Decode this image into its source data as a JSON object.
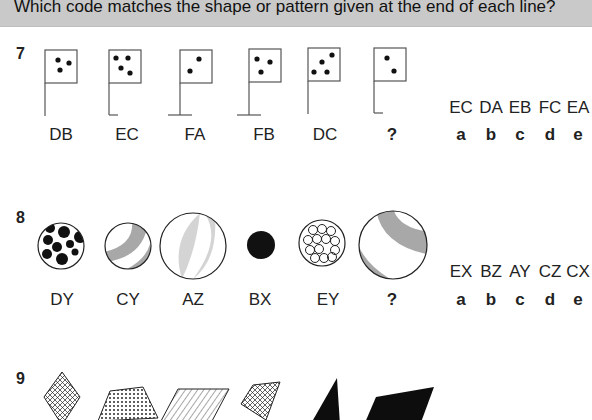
{
  "header": {
    "instruction": "Which code matches the shape or pattern given at the end of each line?"
  },
  "questions": [
    {
      "number": "7",
      "figures": [
        {
          "code": "DB",
          "description": "flag with 3 dots, plain pole"
        },
        {
          "code": "EC",
          "description": "flag with 4 dots, pole with right foot"
        },
        {
          "code": "FA",
          "description": "flag with 2 dots, pole with full base"
        },
        {
          "code": "FB",
          "description": "flag with 3 dots, pole with full base"
        },
        {
          "code": "DC",
          "description": "flag with 4 dots, plain pole"
        },
        {
          "code": "?",
          "description": "flag with 2 dots, pole with right foot"
        }
      ],
      "options": [
        {
          "code": "EC",
          "letter": "a"
        },
        {
          "code": "DA",
          "letter": "b"
        },
        {
          "code": "EB",
          "letter": "c"
        },
        {
          "code": "FC",
          "letter": "d"
        },
        {
          "code": "EA",
          "letter": "e"
        }
      ]
    },
    {
      "number": "8",
      "figures": [
        {
          "code": "DY",
          "description": "medium circle with black spots"
        },
        {
          "code": "CY",
          "description": "medium circle with grey curved band"
        },
        {
          "code": "AZ",
          "description": "large circle with light grey lens bands"
        },
        {
          "code": "BX",
          "description": "small black circle"
        },
        {
          "code": "EY",
          "description": "medium circle with small white circles"
        },
        {
          "code": "?",
          "description": "large circle with grey curved band"
        }
      ],
      "options": [
        {
          "code": "EX",
          "letter": "a"
        },
        {
          "code": "BZ",
          "letter": "b"
        },
        {
          "code": "AY",
          "letter": "c"
        },
        {
          "code": "CZ",
          "letter": "d"
        },
        {
          "code": "CX",
          "letter": "e"
        }
      ]
    },
    {
      "number": "9",
      "figures": [
        {
          "description": "cross-hatched diamond"
        },
        {
          "description": "dotted trapezoid"
        },
        {
          "description": "striped parallelogram"
        },
        {
          "description": "cross-hatched quadrilateral"
        },
        {
          "description": "black triangle"
        },
        {
          "description": "black parallelogram"
        }
      ]
    }
  ]
}
